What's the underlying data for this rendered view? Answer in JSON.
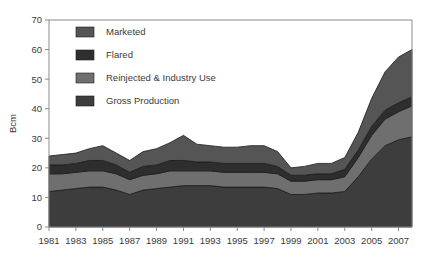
{
  "chart_data": {
    "type": "area",
    "stacked": true,
    "title": "",
    "subtitle": "",
    "xlabel": "",
    "ylabel": "Bcm",
    "xlim": [
      1981,
      2008
    ],
    "ylim": [
      0,
      70
    ],
    "yticks": [
      0,
      10,
      20,
      30,
      40,
      50,
      60,
      70
    ],
    "xticks": [
      1981,
      1983,
      1985,
      1987,
      1989,
      1991,
      1993,
      1995,
      1997,
      1999,
      2001,
      2003,
      2005,
      2007
    ],
    "xticklabels": [
      "1981",
      "1983",
      "1985",
      "1987",
      "1989",
      "1991",
      "1993",
      "1995",
      "1997",
      "1999",
      "2001",
      "2003",
      "2005",
      "2007"
    ],
    "yticklabels": [
      "0",
      "10",
      "20",
      "30",
      "40",
      "50",
      "60",
      "70"
    ],
    "grid": false,
    "legend_position": "upper-left",
    "x": [
      1981,
      1982,
      1983,
      1984,
      1985,
      1986,
      1987,
      1988,
      1989,
      1990,
      1991,
      1992,
      1993,
      1994,
      1995,
      1996,
      1997,
      1998,
      1999,
      2000,
      2001,
      2002,
      2003,
      2004,
      2005,
      2006,
      2007,
      2008
    ],
    "series": [
      {
        "name": "Gross Production",
        "color": "#3d3d3d",
        "values": [
          12.0,
          12.5,
          13.0,
          13.5,
          13.5,
          12.5,
          11.0,
          12.5,
          13.0,
          13.5,
          14.0,
          14.0,
          14.0,
          13.5,
          13.5,
          13.5,
          13.5,
          13.0,
          11.0,
          11.0,
          11.5,
          11.5,
          12.0,
          17.0,
          23.0,
          27.5,
          29.5,
          30.5
        ]
      },
      {
        "name": "Reinjected & Industry Use",
        "color": "#6f6f6f",
        "values": [
          6.0,
          5.5,
          5.5,
          5.5,
          5.5,
          5.5,
          5.0,
          5.0,
          5.0,
          5.5,
          5.0,
          5.0,
          5.0,
          5.0,
          5.0,
          5.0,
          5.0,
          5.0,
          4.5,
          4.5,
          4.5,
          4.5,
          5.0,
          6.5,
          8.0,
          9.0,
          9.5,
          10.5
        ]
      },
      {
        "name": "Flared",
        "color": "#2e2e2e",
        "values": [
          3.0,
          3.0,
          3.0,
          3.5,
          3.5,
          3.0,
          2.5,
          3.0,
          3.0,
          3.5,
          3.5,
          3.0,
          3.0,
          3.0,
          3.0,
          3.0,
          3.0,
          2.5,
          2.0,
          2.0,
          2.0,
          2.0,
          2.5,
          2.5,
          3.0,
          3.0,
          3.0,
          3.0
        ]
      },
      {
        "name": "Marketed",
        "color": "#555555",
        "values": [
          3.0,
          3.5,
          3.5,
          4.0,
          5.0,
          4.0,
          4.0,
          5.0,
          5.5,
          6.0,
          8.5,
          6.0,
          5.5,
          5.5,
          5.5,
          6.0,
          6.0,
          5.0,
          2.5,
          3.0,
          3.5,
          3.5,
          4.0,
          6.0,
          9.5,
          13.0,
          15.5,
          16.0
        ]
      }
    ],
    "legend_order": [
      "Marketed",
      "Flared",
      "Reinjected & Industry Use",
      "Gross Production"
    ],
    "legend": [
      {
        "label": "Marketed",
        "color": "#555555"
      },
      {
        "label": "Flared",
        "color": "#2e2e2e"
      },
      {
        "label": "Reinjected & Industry Use",
        "color": "#6f6f6f"
      },
      {
        "label": "Gross Production",
        "color": "#3d3d3d"
      }
    ]
  },
  "colors": {
    "background": "#ffffff",
    "axis": "#8a8a8a",
    "text": "#3a3a3a",
    "outline": "#1c1c1c"
  }
}
